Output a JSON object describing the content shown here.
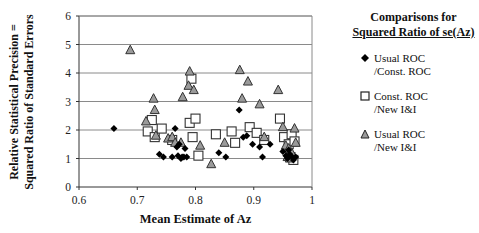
{
  "chart_data": {
    "type": "scatter",
    "title": "",
    "xlabel": "Mean Estimate of Az",
    "ylabel": "Relative Statistical Precision = Squared Ratio of Standard Errors",
    "ylabel_lines": [
      "Relative Statistical Precision =",
      "Squared Ratio of Standard Errors"
    ],
    "xlim": [
      0.6,
      1.0
    ],
    "ylim": [
      0,
      6
    ],
    "xticks": [
      "0.6",
      "0.7",
      "0.8",
      "0.9",
      "1"
    ],
    "yticks": [
      "0",
      "1",
      "2",
      "3",
      "4",
      "5",
      "6"
    ],
    "grid": "horizontal",
    "legend_position": "right",
    "legend_title": [
      "Comparisons for",
      "Squared Ratio of se(Az)"
    ],
    "series": [
      {
        "name": "Usual ROC /Const. ROC",
        "label_lines": [
          "Usual ROC",
          "/Const. ROC"
        ],
        "marker": "diamond",
        "color": "#000000",
        "points": [
          [
            0.66,
            2.05
          ],
          [
            0.738,
            1.15
          ],
          [
            0.745,
            1.05
          ],
          [
            0.76,
            1.05
          ],
          [
            0.765,
            2.05
          ],
          [
            0.768,
            1.4
          ],
          [
            0.77,
            1.1
          ],
          [
            0.775,
            1.0
          ],
          [
            0.777,
            1.05
          ],
          [
            0.78,
            1.05
          ],
          [
            0.772,
            1.5
          ],
          [
            0.785,
            1.05
          ],
          [
            0.782,
            1.35
          ],
          [
            0.84,
            1.2
          ],
          [
            0.852,
            1.05
          ],
          [
            0.875,
            2.7
          ],
          [
            0.882,
            1.75
          ],
          [
            0.888,
            1.8
          ],
          [
            0.898,
            1.5
          ],
          [
            0.91,
            1.4
          ],
          [
            0.915,
            1.05
          ],
          [
            0.928,
            1.5
          ],
          [
            0.95,
            1.25
          ],
          [
            0.955,
            1.1
          ],
          [
            0.958,
            1.0
          ],
          [
            0.962,
            1.15
          ],
          [
            0.966,
            1.05
          ],
          [
            0.968,
            0.95
          ],
          [
            0.972,
            1.05
          ],
          [
            0.96,
            1.3
          ]
        ]
      },
      {
        "name": "Const. ROC /New I&I",
        "label_lines": [
          "Const. ROC",
          "/New  I&I"
        ],
        "marker": "square",
        "color": "#ffffff",
        "points": [
          [
            0.725,
            2.35
          ],
          [
            0.718,
            1.95
          ],
          [
            0.73,
            1.75
          ],
          [
            0.742,
            2.05
          ],
          [
            0.76,
            1.65
          ],
          [
            0.79,
            2.25
          ],
          [
            0.8,
            2.4
          ],
          [
            0.795,
            1.75
          ],
          [
            0.805,
            1.1
          ],
          [
            0.793,
            3.8
          ],
          [
            0.835,
            1.85
          ],
          [
            0.862,
            1.95
          ],
          [
            0.868,
            1.55
          ],
          [
            0.893,
            2.1
          ],
          [
            0.905,
            1.9
          ],
          [
            0.918,
            1.65
          ],
          [
            0.945,
            2.4
          ],
          [
            0.952,
            1.75
          ],
          [
            0.96,
            1.5
          ],
          [
            0.965,
            1.85
          ],
          [
            0.97,
            1.6
          ],
          [
            0.963,
            1.05
          ],
          [
            0.968,
            0.95
          ]
        ]
      },
      {
        "name": "Usual ROC /New I&I",
        "label_lines": [
          "Usual  ROC",
          "/New I&I"
        ],
        "marker": "triangle",
        "color": "#9a9a9a",
        "points": [
          [
            0.688,
            4.8
          ],
          [
            0.715,
            2.3
          ],
          [
            0.728,
            3.1
          ],
          [
            0.73,
            2.7
          ],
          [
            0.732,
            1.8
          ],
          [
            0.753,
            1.7
          ],
          [
            0.76,
            1.75
          ],
          [
            0.765,
            1.55
          ],
          [
            0.775,
            1.55
          ],
          [
            0.778,
            3.15
          ],
          [
            0.79,
            4.05
          ],
          [
            0.788,
            3.55
          ],
          [
            0.797,
            3.4
          ],
          [
            0.808,
            1.45
          ],
          [
            0.827,
            0.8
          ],
          [
            0.876,
            4.1
          ],
          [
            0.89,
            3.7
          ],
          [
            0.88,
            3.1
          ],
          [
            0.91,
            2.9
          ],
          [
            0.918,
            1.75
          ],
          [
            0.942,
            3.4
          ],
          [
            0.95,
            2.1
          ],
          [
            0.955,
            1.45
          ],
          [
            0.96,
            1.35
          ],
          [
            0.965,
            1.2
          ],
          [
            0.97,
            2.05
          ],
          [
            0.972,
            1.55
          ],
          [
            0.958,
            1.05
          ],
          [
            0.962,
            1.0
          ],
          [
            0.85,
            1.55
          ]
        ]
      }
    ]
  }
}
